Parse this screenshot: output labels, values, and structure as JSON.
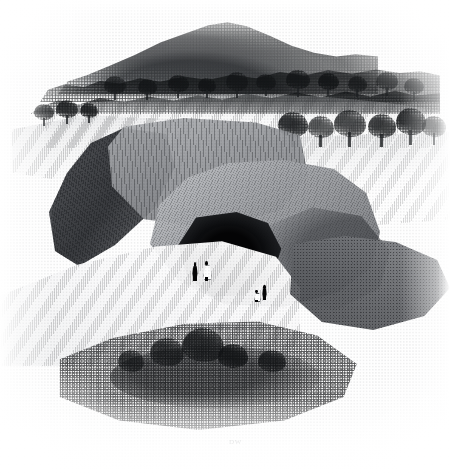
{
  "artwork": {
    "title": "Rocky Chasm with Cave Entrance",
    "medium": "wood engraving",
    "palette": {
      "paper": "#fefefe",
      "ink_darkest": "#050506",
      "ink_dark": "#2e3034",
      "ink_mid": "#86888c",
      "ink_light": "#c8cacd",
      "highlight": "#ffffff"
    },
    "canvas": {
      "width": 450,
      "height": 474
    }
  },
  "inscriptions": {
    "monogram": "DW",
    "engraver_mark_left": "",
    "engraver_mark_right": ""
  },
  "scene": {
    "background": {
      "hill": {
        "label": "wooded background hill"
      },
      "tree_belt_far": {
        "label": "far tree belt on skyline"
      },
      "tree_belt_near": {
        "label": "second tree belt"
      }
    },
    "midground": {
      "plateau": {
        "label": "grassy plateau above the cliff"
      },
      "meadow_right": {
        "label": "sloping field on the right"
      },
      "field_left": {
        "label": "field on the left"
      },
      "trees": [
        {
          "label": "plateau tree 1",
          "x": 104,
          "y": 76,
          "w": 22,
          "h": 24
        },
        {
          "label": "plateau tree 2",
          "x": 138,
          "y": 79,
          "w": 19,
          "h": 21
        },
        {
          "label": "plateau tree 3",
          "x": 168,
          "y": 75,
          "w": 21,
          "h": 23
        },
        {
          "label": "plateau tree 4",
          "x": 198,
          "y": 78,
          "w": 18,
          "h": 20
        },
        {
          "label": "plateau tree 5",
          "x": 226,
          "y": 72,
          "w": 22,
          "h": 25
        },
        {
          "label": "plateau tree 6",
          "x": 256,
          "y": 74,
          "w": 20,
          "h": 22
        },
        {
          "label": "plateau tree 7",
          "x": 286,
          "y": 70,
          "w": 24,
          "h": 26
        },
        {
          "label": "plateau tree 8",
          "x": 318,
          "y": 73,
          "w": 21,
          "h": 23
        },
        {
          "label": "plateau tree 9",
          "x": 348,
          "y": 76,
          "w": 19,
          "h": 21
        },
        {
          "label": "plateau tree 10",
          "x": 376,
          "y": 72,
          "w": 22,
          "h": 24
        },
        {
          "label": "plateau tree 11",
          "x": 404,
          "y": 78,
          "w": 20,
          "h": 22
        },
        {
          "label": "rim tree 1",
          "x": 278,
          "y": 112,
          "w": 30,
          "h": 34
        },
        {
          "label": "rim tree 2",
          "x": 308,
          "y": 116,
          "w": 26,
          "h": 30
        },
        {
          "label": "rim tree 3",
          "x": 334,
          "y": 110,
          "w": 32,
          "h": 36
        },
        {
          "label": "rim tree 4",
          "x": 368,
          "y": 114,
          "w": 28,
          "h": 32
        },
        {
          "label": "rim tree 5",
          "x": 396,
          "y": 108,
          "w": 30,
          "h": 36
        },
        {
          "label": "rim tree 6",
          "x": 422,
          "y": 116,
          "w": 24,
          "h": 28
        },
        {
          "label": "left slope tree 1",
          "x": 34,
          "y": 104,
          "w": 20,
          "h": 22
        },
        {
          "label": "left slope tree 2",
          "x": 56,
          "y": 100,
          "w": 22,
          "h": 24
        },
        {
          "label": "left slope tree 3",
          "x": 80,
          "y": 103,
          "w": 18,
          "h": 20
        }
      ]
    },
    "foreground": {
      "cliff_upper": {
        "label": "upper cliff face"
      },
      "wall_left": {
        "label": "shadowed left chasm wall"
      },
      "boulder": {
        "label": "great tilted rock mass"
      },
      "cave": {
        "label": "dark cave mouth"
      },
      "scree": {
        "label": "bright scree slope"
      },
      "spur": {
        "label": "lower right rocky spur"
      },
      "rubble": {
        "label": "foreground rubble and scrub"
      },
      "bushes": [
        {
          "label": "foreground bush 1",
          "x": 150,
          "y": 338,
          "w": 34,
          "h": 28
        },
        {
          "label": "foreground bush 2",
          "x": 182,
          "y": 328,
          "w": 42,
          "h": 34
        },
        {
          "label": "foreground bush 3",
          "x": 218,
          "y": 344,
          "w": 30,
          "h": 24
        },
        {
          "label": "foreground bush 4",
          "x": 118,
          "y": 350,
          "w": 26,
          "h": 22
        },
        {
          "label": "foreground bush 5",
          "x": 258,
          "y": 350,
          "w": 28,
          "h": 22
        }
      ]
    },
    "figures": [
      {
        "label": "standing figure dark coat",
        "x": 192,
        "y": 262,
        "w": 6,
        "h": 19,
        "tone": "dark"
      },
      {
        "label": "standing figure light dress",
        "x": 203,
        "y": 261,
        "w": 7,
        "h": 20,
        "tone": "light"
      },
      {
        "label": "cave figure light",
        "x": 254,
        "y": 290,
        "w": 5,
        "h": 12,
        "tone": "light"
      },
      {
        "label": "cave figure dark",
        "x": 262,
        "y": 285,
        "w": 5,
        "h": 15,
        "tone": "dark"
      }
    ]
  }
}
